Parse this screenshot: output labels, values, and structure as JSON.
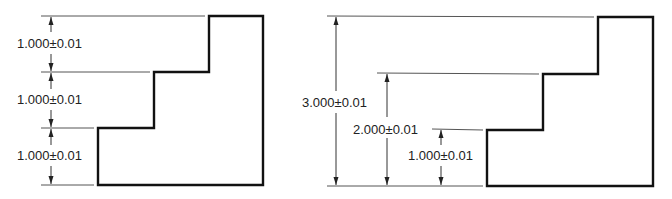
{
  "diagrams": [
    {
      "name": "chain-dimensioning",
      "dimensions": [
        {
          "label": "1.000±0.01"
        },
        {
          "label": "1.000±0.01"
        },
        {
          "label": "1.000±0.01"
        }
      ]
    },
    {
      "name": "baseline-dimensioning",
      "dimensions": [
        {
          "label": "3.000±0.01"
        },
        {
          "label": "2.000±0.01"
        },
        {
          "label": "1.000±0.01"
        }
      ]
    }
  ]
}
